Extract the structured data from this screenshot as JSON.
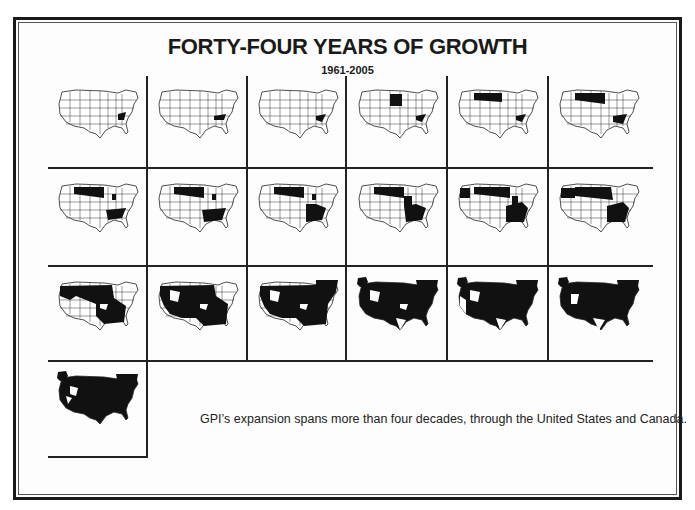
{
  "header": {
    "title": "FORTY-FOUR YEARS OF GROWTH",
    "subtitle": "1961-2005"
  },
  "caption": "GPI’s expansion spans more than four decades, through the United States and Canada.",
  "colors": {
    "ink": "#1a1a1a",
    "background": "#ffffff"
  },
  "maps": [
    {
      "index": 1,
      "icon": "us-map-icon",
      "coverage": "single southeastern state"
    },
    {
      "index": 2,
      "icon": "us-map-icon",
      "coverage": "single southeastern state"
    },
    {
      "index": 3,
      "icon": "us-map-icon",
      "coverage": "single southeastern state"
    },
    {
      "index": 4,
      "icon": "us-map-icon",
      "coverage": "southeast + upper midwest"
    },
    {
      "index": 5,
      "icon": "us-map-icon",
      "coverage": "southeast + northern plains"
    },
    {
      "index": 6,
      "icon": "us-map-icon",
      "coverage": "southeast + northern plains"
    },
    {
      "index": 7,
      "icon": "us-map-icon",
      "coverage": "southeast + northern plains + midwest"
    },
    {
      "index": 8,
      "icon": "us-map-icon",
      "coverage": "southeast + northern plains + midwest"
    },
    {
      "index": 9,
      "icon": "us-map-icon",
      "coverage": "southeast + northern plains + midwest"
    },
    {
      "index": 10,
      "icon": "us-map-icon",
      "coverage": "southeast + northern plains + midwest"
    },
    {
      "index": 11,
      "icon": "us-map-icon",
      "coverage": "southeast + north + northwest"
    },
    {
      "index": 12,
      "icon": "us-map-icon",
      "coverage": "southeast + north + northwest"
    },
    {
      "index": 13,
      "icon": "us-map-icon",
      "coverage": "most of central and eastern US"
    },
    {
      "index": 14,
      "icon": "us-map-icon",
      "coverage": "most of US"
    },
    {
      "index": 15,
      "icon": "us-map-icon",
      "coverage": "most of US + eastern Canada"
    },
    {
      "index": 16,
      "icon": "us-map-icon",
      "coverage": "US + Canada + Alaska"
    },
    {
      "index": 17,
      "icon": "us-map-icon",
      "coverage": "US + Canada + Alaska"
    },
    {
      "index": 18,
      "icon": "us-map-icon",
      "coverage": "US + Canada + Alaska"
    },
    {
      "index": 19,
      "icon": "us-map-icon",
      "coverage": "nearly all of US + Canada + Alaska"
    }
  ]
}
